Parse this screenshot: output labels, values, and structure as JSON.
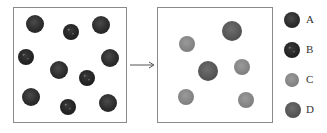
{
  "diagram": {
    "left_panel": {
      "balls": [
        {
          "type": "A",
          "x": 35,
          "y": 24,
          "r": 9
        },
        {
          "type": "A",
          "x": 101,
          "y": 25,
          "r": 9
        },
        {
          "type": "A",
          "x": 59,
          "y": 70,
          "r": 9
        },
        {
          "type": "A",
          "x": 110,
          "y": 58,
          "r": 9
        },
        {
          "type": "A",
          "x": 31,
          "y": 97,
          "r": 9
        },
        {
          "type": "A",
          "x": 108,
          "y": 103,
          "r": 9
        },
        {
          "type": "B",
          "x": 71,
          "y": 32,
          "r": 8
        },
        {
          "type": "B",
          "x": 26,
          "y": 57,
          "r": 8
        },
        {
          "type": "B",
          "x": 87,
          "y": 78,
          "r": 8
        },
        {
          "type": "B",
          "x": 68,
          "y": 107,
          "r": 8
        }
      ]
    },
    "right_panel": {
      "balls": [
        {
          "type": "D",
          "x": 232,
          "y": 31,
          "r": 10
        },
        {
          "type": "D",
          "x": 208,
          "y": 71,
          "r": 10
        },
        {
          "type": "C",
          "x": 187,
          "y": 44,
          "r": 8
        },
        {
          "type": "C",
          "x": 242,
          "y": 67,
          "r": 8
        },
        {
          "type": "C",
          "x": 186,
          "y": 97,
          "r": 8
        },
        {
          "type": "C",
          "x": 246,
          "y": 100,
          "r": 8
        }
      ]
    },
    "arrow": {
      "from_x": 130,
      "to_x": 154,
      "y": 65
    },
    "legend": [
      {
        "type": "A",
        "label": "A",
        "x": 292,
        "y": 20,
        "r": 8
      },
      {
        "type": "B",
        "label": "B",
        "x": 292,
        "y": 50,
        "r": 8
      },
      {
        "type": "C",
        "label": "C",
        "x": 292,
        "y": 80,
        "r": 7
      },
      {
        "type": "D",
        "label": "D",
        "x": 293,
        "y": 110,
        "r": 8
      }
    ]
  }
}
